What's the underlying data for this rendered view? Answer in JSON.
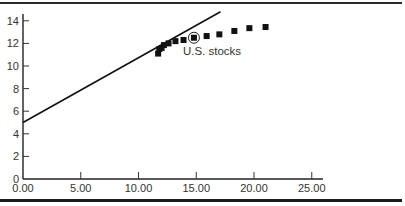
{
  "chart_data": {
    "type": "scatter",
    "title": "",
    "xlabel": "",
    "ylabel": "",
    "xlim": [
      0,
      26
    ],
    "ylim": [
      0,
      15
    ],
    "x_ticks": [
      "0.00",
      "5.00",
      "10.00",
      "15.00",
      "20.00",
      "25.00"
    ],
    "y_ticks": [
      "0",
      "2",
      "4",
      "6",
      "8",
      "10",
      "12",
      "14"
    ],
    "grid": false,
    "legend": null,
    "series": [
      {
        "name": "Portfolios",
        "type": "scatter",
        "marker": "square",
        "color": "#111111",
        "x": [
          11.7,
          11.8,
          12.0,
          12.2,
          12.6,
          13.2,
          13.9,
          14.8,
          15.9,
          17.0,
          18.3,
          19.6,
          21.0
        ],
        "y": [
          11.1,
          11.5,
          11.6,
          11.85,
          12.0,
          12.2,
          12.3,
          12.5,
          12.65,
          12.8,
          13.1,
          13.35,
          13.45
        ]
      },
      {
        "name": "Capital market line",
        "type": "line",
        "color": "#111111",
        "x": [
          0,
          17.1
        ],
        "y": [
          5.0,
          14.8
        ]
      }
    ],
    "annotations": [
      {
        "text": "U.S. stocks",
        "x": 14.8,
        "y": 12.5,
        "marker": "circled-point"
      }
    ]
  }
}
